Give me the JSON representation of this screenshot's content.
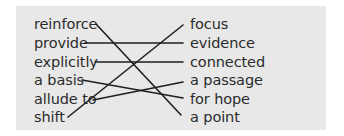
{
  "exercise": {
    "type": "matching",
    "left_items": [
      "reinforce",
      "provide",
      "explicitly",
      "a basis",
      "allude to",
      "shift"
    ],
    "right_items": [
      "focus",
      "evidence",
      "connected",
      "a passage",
      "for hope",
      "a point"
    ],
    "matches": [
      {
        "left": "reinforce",
        "right": "a point"
      },
      {
        "left": "provide",
        "right": "evidence"
      },
      {
        "left": "explicitly",
        "right": "connected"
      },
      {
        "left": "a basis",
        "right": "for hope"
      },
      {
        "left": "allude to",
        "right": "a passage"
      },
      {
        "left": "shift",
        "right": "focus"
      }
    ]
  },
  "colors": {
    "panel_background": "#e8e8e8",
    "text": "#2b2b2b",
    "line": "#1f1f1f"
  }
}
